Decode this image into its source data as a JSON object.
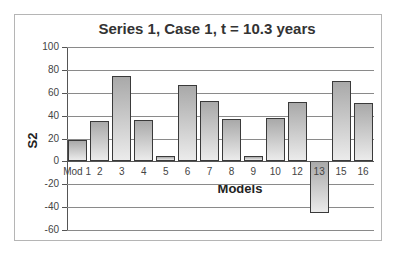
{
  "chart_data": {
    "type": "bar",
    "title": "Series 1, Case 1, t = 10.3 years",
    "xlabel": "Models",
    "ylabel": "S2",
    "ylim": [
      -60,
      100
    ],
    "yticks": [
      100,
      80,
      60,
      40,
      20,
      0,
      -20,
      -40,
      -60
    ],
    "grid": true,
    "legend": null,
    "categories": [
      "Mod 1",
      "2",
      "3",
      "4",
      "5",
      "6",
      "7",
      "8",
      "9",
      "10",
      "12",
      "13",
      "15",
      "16"
    ],
    "values": [
      19,
      35,
      75,
      36,
      5,
      67,
      53,
      37,
      5,
      38,
      52,
      -45,
      70,
      51
    ]
  },
  "colors": {
    "bar_top": "#a9a9a9",
    "bar_bottom": "#ebebeb",
    "bar_border": "#3a3a3a",
    "gridline": "#8a8a8a"
  }
}
